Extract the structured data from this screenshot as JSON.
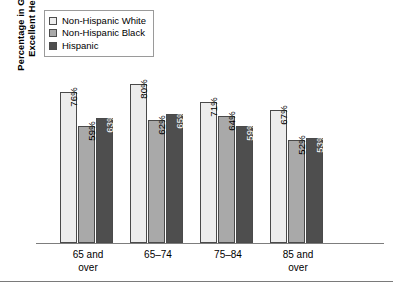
{
  "chart_data": {
    "type": "bar",
    "title": "",
    "xlabel": "",
    "ylabel": "Percentage in Good to Excellent Health",
    "ylabel_line1": "Percentage in Good to",
    "ylabel_line2": "Excellent Health",
    "ylim": [
      0,
      100
    ],
    "grid": false,
    "legend_position": "top-left",
    "categories": [
      "65 and over",
      "65–74",
      "75–84",
      "85 and over"
    ],
    "category_lines": [
      [
        "65 and",
        "over"
      ],
      [
        "65–74",
        ""
      ],
      [
        "75–84",
        ""
      ],
      [
        "85 and",
        "over"
      ]
    ],
    "series": [
      {
        "name": "Non-Hispanic White",
        "color": "#ededed",
        "values": [
          76,
          59,
          71,
          67
        ],
        "labels": [
          "76%",
          "71%",
          "67%"
        ]
      },
      {
        "name": "Non-Hispanic Black",
        "color": "#a9a9a9",
        "values": [
          59,
          62,
          64,
          52
        ],
        "labels": [
          "59%",
          "62%",
          "64%",
          "52%"
        ]
      },
      {
        "name": "Hispanic",
        "color": "#4e4e4e",
        "values": [
          63,
          65,
          59,
          53
        ],
        "labels": [
          "63%",
          "65%",
          "59%",
          "53%"
        ]
      }
    ],
    "groups": [
      {
        "category_line1": "65 and",
        "category_line2": "over",
        "bars": [
          {
            "series": "Non-Hispanic White",
            "value": 76,
            "label": "76%",
            "shade": "w"
          },
          {
            "series": "Non-Hispanic Black",
            "value": 59,
            "label": "59%",
            "shade": "g"
          },
          {
            "series": "Hispanic",
            "value": 63,
            "label": "63%",
            "shade": "d"
          }
        ]
      },
      {
        "category_line1": "65–74",
        "category_line2": "",
        "bars": [
          {
            "series": "Non-Hispanic White",
            "value": 80,
            "label": "80%",
            "shade": "w"
          },
          {
            "series": "Non-Hispanic Black",
            "value": 62,
            "label": "62%",
            "shade": "g"
          },
          {
            "series": "Hispanic",
            "value": 65,
            "label": "65%",
            "shade": "d"
          }
        ]
      },
      {
        "category_line1": "75–84",
        "category_line2": "",
        "bars": [
          {
            "series": "Non-Hispanic White",
            "value": 71,
            "label": "71%",
            "shade": "w"
          },
          {
            "series": "Non-Hispanic Black",
            "value": 64,
            "label": "64%",
            "shade": "g"
          },
          {
            "series": "Hispanic",
            "value": 59,
            "label": "59%",
            "shade": "d"
          }
        ]
      },
      {
        "category_line1": "85 and",
        "category_line2": "over",
        "bars": [
          {
            "series": "Non-Hispanic White",
            "value": 67,
            "label": "67%",
            "shade": "w"
          },
          {
            "series": "Non-Hispanic Black",
            "value": 52,
            "label": "52%",
            "shade": "g"
          },
          {
            "series": "Hispanic",
            "value": 53,
            "label": "53%",
            "shade": "d"
          }
        ]
      }
    ]
  },
  "legend": {
    "items": [
      {
        "label": "Non-Hispanic White",
        "color": "#ededed"
      },
      {
        "label": "Non-Hispanic Black",
        "color": "#a9a9a9"
      },
      {
        "label": "Hispanic",
        "color": "#4e4e4e"
      }
    ]
  },
  "axis": {
    "baseline_color": "#7d7d7d",
    "max_value": 92
  }
}
